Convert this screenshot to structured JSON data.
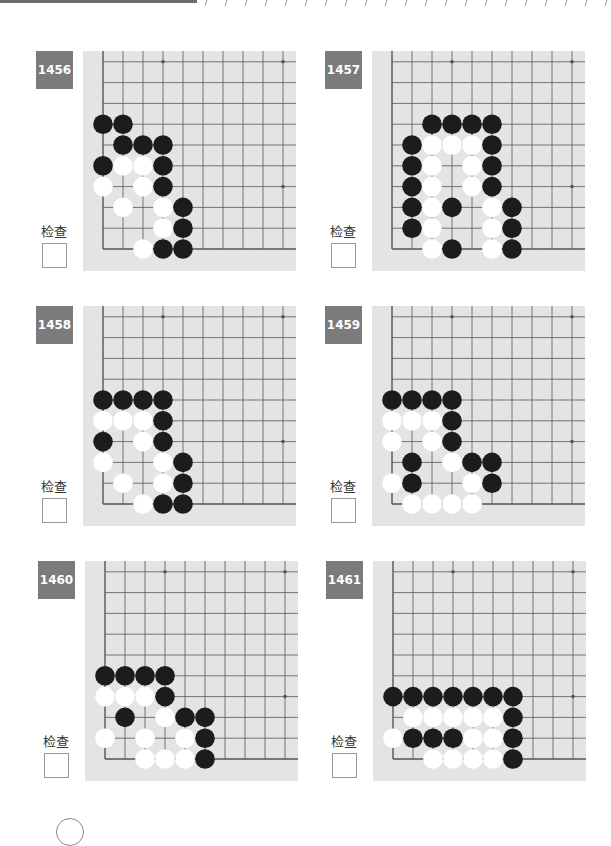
{
  "page": {
    "check_label": "检查",
    "colors": {
      "badge": "#7b7b7b",
      "board": "#e4e4e4",
      "grid": "#555555",
      "black_stone": "#1c1c1c",
      "white_stone": "#ffffff"
    }
  },
  "grid": {
    "cols": 10,
    "rows": 10,
    "col_spacing": 20,
    "row_spacing": 20.8,
    "hoshi": [
      [
        3,
        9
      ],
      [
        9,
        9
      ],
      [
        9,
        3
      ]
    ]
  },
  "problems": [
    {
      "number": "1456",
      "black": [
        [
          0,
          6
        ],
        [
          1,
          6
        ],
        [
          1,
          5
        ],
        [
          2,
          5
        ],
        [
          3,
          5
        ],
        [
          0,
          4
        ],
        [
          3,
          4
        ],
        [
          3,
          3
        ],
        [
          4,
          2
        ],
        [
          4,
          1
        ],
        [
          3,
          0
        ],
        [
          4,
          0
        ]
      ],
      "white": [
        [
          1,
          4
        ],
        [
          2,
          4
        ],
        [
          0,
          3
        ],
        [
          2,
          3
        ],
        [
          1,
          2
        ],
        [
          3,
          2
        ],
        [
          3,
          1
        ],
        [
          2,
          0
        ]
      ]
    },
    {
      "number": "1457",
      "black": [
        [
          2,
          6
        ],
        [
          3,
          6
        ],
        [
          4,
          6
        ],
        [
          5,
          6
        ],
        [
          1,
          5
        ],
        [
          5,
          5
        ],
        [
          1,
          4
        ],
        [
          5,
          4
        ],
        [
          1,
          3
        ],
        [
          5,
          3
        ],
        [
          1,
          2
        ],
        [
          3,
          2
        ],
        [
          6,
          2
        ],
        [
          1,
          1
        ],
        [
          6,
          1
        ],
        [
          3,
          0
        ],
        [
          6,
          0
        ]
      ],
      "white": [
        [
          2,
          5
        ],
        [
          3,
          5
        ],
        [
          4,
          5
        ],
        [
          2,
          4
        ],
        [
          4,
          4
        ],
        [
          2,
          3
        ],
        [
          4,
          3
        ],
        [
          2,
          2
        ],
        [
          5,
          2
        ],
        [
          2,
          1
        ],
        [
          5,
          1
        ],
        [
          2,
          0
        ],
        [
          5,
          0
        ]
      ]
    },
    {
      "number": "1458",
      "black": [
        [
          0,
          5
        ],
        [
          1,
          5
        ],
        [
          2,
          5
        ],
        [
          3,
          5
        ],
        [
          3,
          4
        ],
        [
          0,
          3
        ],
        [
          3,
          3
        ],
        [
          4,
          2
        ],
        [
          4,
          1
        ],
        [
          3,
          0
        ],
        [
          4,
          0
        ]
      ],
      "white": [
        [
          0,
          4
        ],
        [
          1,
          4
        ],
        [
          2,
          4
        ],
        [
          2,
          3
        ],
        [
          0,
          2
        ],
        [
          3,
          2
        ],
        [
          1,
          1
        ],
        [
          3,
          1
        ],
        [
          2,
          0
        ]
      ]
    },
    {
      "number": "1459",
      "black": [
        [
          0,
          5
        ],
        [
          1,
          5
        ],
        [
          2,
          5
        ],
        [
          3,
          5
        ],
        [
          3,
          4
        ],
        [
          3,
          3
        ],
        [
          1,
          2
        ],
        [
          4,
          2
        ],
        [
          5,
          2
        ],
        [
          1,
          1
        ],
        [
          5,
          1
        ]
      ],
      "white": [
        [
          0,
          4
        ],
        [
          1,
          4
        ],
        [
          2,
          4
        ],
        [
          0,
          3
        ],
        [
          2,
          3
        ],
        [
          3,
          2
        ],
        [
          0,
          1
        ],
        [
          4,
          1
        ],
        [
          1,
          0
        ],
        [
          2,
          0
        ],
        [
          3,
          0
        ],
        [
          4,
          0
        ]
      ]
    },
    {
      "number": "1460",
      "black": [
        [
          0,
          4
        ],
        [
          1,
          4
        ],
        [
          2,
          4
        ],
        [
          3,
          4
        ],
        [
          3,
          3
        ],
        [
          1,
          2
        ],
        [
          4,
          2
        ],
        [
          5,
          2
        ],
        [
          5,
          1
        ],
        [
          5,
          0
        ]
      ],
      "white": [
        [
          0,
          3
        ],
        [
          1,
          3
        ],
        [
          2,
          3
        ],
        [
          3,
          2
        ],
        [
          0,
          1
        ],
        [
          2,
          1
        ],
        [
          4,
          1
        ],
        [
          2,
          0
        ],
        [
          3,
          0
        ],
        [
          4,
          0
        ]
      ]
    },
    {
      "number": "1461",
      "black": [
        [
          0,
          3
        ],
        [
          1,
          3
        ],
        [
          2,
          3
        ],
        [
          3,
          3
        ],
        [
          4,
          3
        ],
        [
          5,
          3
        ],
        [
          6,
          3
        ],
        [
          6,
          2
        ],
        [
          1,
          1
        ],
        [
          2,
          1
        ],
        [
          3,
          1
        ],
        [
          6,
          1
        ],
        [
          6,
          0
        ]
      ],
      "white": [
        [
          1,
          2
        ],
        [
          2,
          2
        ],
        [
          3,
          2
        ],
        [
          4,
          2
        ],
        [
          5,
          2
        ],
        [
          0,
          1
        ],
        [
          4,
          1
        ],
        [
          5,
          1
        ],
        [
          2,
          0
        ],
        [
          3,
          0
        ],
        [
          4,
          0
        ],
        [
          5,
          0
        ]
      ]
    }
  ]
}
